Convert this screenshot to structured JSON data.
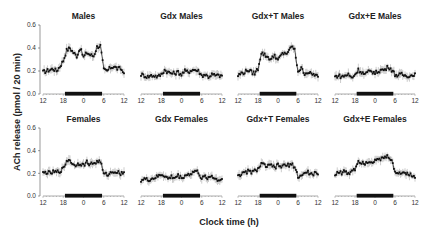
{
  "chart_data": {
    "type": "line",
    "layout": "2x4 small multiples with error bars",
    "ylabel": "ACh release (pmol / 20 min)",
    "xlabel": "Clock time (h)",
    "ylim": [
      0.0,
      0.6
    ],
    "yticks": [
      "0.0",
      "0.2",
      "0.4",
      "0.6"
    ],
    "xticks": [
      "12",
      "18",
      "0",
      "6",
      "12"
    ],
    "dark_period": {
      "start_hour": 18.5,
      "end_hour": 5.5,
      "label": "dark phase bar"
    },
    "grid": false,
    "legend": null,
    "panels": [
      {
        "title": "Males",
        "row": 0,
        "col": 0,
        "x": [
          12,
          13,
          14,
          15,
          16,
          17,
          18,
          19,
          20,
          21,
          22,
          23,
          0,
          1,
          2,
          3,
          4,
          5,
          6,
          7,
          8,
          9,
          10,
          11,
          12
        ],
        "values": [
          0.19,
          0.2,
          0.21,
          0.22,
          0.2,
          0.24,
          0.29,
          0.38,
          0.4,
          0.36,
          0.33,
          0.4,
          0.32,
          0.36,
          0.34,
          0.33,
          0.41,
          0.42,
          0.21,
          0.2,
          0.23,
          0.24,
          0.22,
          0.22,
          0.18
        ]
      },
      {
        "title": "Gdx Males",
        "row": 0,
        "col": 1,
        "x": [
          12,
          13,
          14,
          15,
          16,
          17,
          18,
          19,
          20,
          21,
          22,
          23,
          0,
          1,
          2,
          3,
          4,
          5,
          6,
          7,
          8,
          9,
          10,
          11,
          12
        ],
        "values": [
          0.17,
          0.16,
          0.15,
          0.16,
          0.16,
          0.15,
          0.17,
          0.21,
          0.19,
          0.18,
          0.18,
          0.19,
          0.17,
          0.2,
          0.19,
          0.21,
          0.21,
          0.2,
          0.16,
          0.17,
          0.15,
          0.17,
          0.16,
          0.16,
          0.16
        ]
      },
      {
        "title": "Gdx+T Males",
        "row": 0,
        "col": 2,
        "x": [
          12,
          13,
          14,
          15,
          16,
          17,
          18,
          19,
          20,
          21,
          22,
          23,
          0,
          1,
          2,
          3,
          4,
          5,
          6,
          7,
          8,
          9,
          10,
          11,
          12
        ],
        "values": [
          0.16,
          0.18,
          0.19,
          0.21,
          0.19,
          0.18,
          0.22,
          0.36,
          0.34,
          0.32,
          0.3,
          0.34,
          0.29,
          0.34,
          0.36,
          0.35,
          0.42,
          0.38,
          0.2,
          0.22,
          0.18,
          0.19,
          0.17,
          0.17,
          0.15
        ]
      },
      {
        "title": "Gdx+E  Males",
        "row": 0,
        "col": 3,
        "x": [
          12,
          13,
          14,
          15,
          16,
          17,
          18,
          19,
          20,
          21,
          22,
          23,
          0,
          1,
          2,
          3,
          4,
          5,
          6,
          7,
          8,
          9,
          10,
          11,
          12
        ],
        "values": [
          0.15,
          0.16,
          0.15,
          0.16,
          0.17,
          0.14,
          0.17,
          0.21,
          0.19,
          0.17,
          0.19,
          0.2,
          0.18,
          0.2,
          0.21,
          0.21,
          0.24,
          0.21,
          0.17,
          0.16,
          0.17,
          0.16,
          0.16,
          0.16,
          0.18
        ]
      },
      {
        "title": "Females",
        "row": 1,
        "col": 0,
        "x": [
          12,
          13,
          14,
          15,
          16,
          17,
          18,
          19,
          20,
          21,
          22,
          23,
          0,
          1,
          2,
          3,
          4,
          5,
          6,
          7,
          8,
          9,
          10,
          11,
          12
        ],
        "values": [
          0.2,
          0.21,
          0.2,
          0.21,
          0.21,
          0.22,
          0.24,
          0.31,
          0.32,
          0.27,
          0.28,
          0.29,
          0.27,
          0.3,
          0.28,
          0.29,
          0.3,
          0.31,
          0.19,
          0.19,
          0.2,
          0.22,
          0.21,
          0.2,
          0.21
        ]
      },
      {
        "title": "Gdx Females",
        "row": 1,
        "col": 1,
        "x": [
          12,
          13,
          14,
          15,
          16,
          17,
          18,
          19,
          20,
          21,
          22,
          23,
          0,
          1,
          2,
          3,
          4,
          5,
          6,
          7,
          8,
          9,
          10,
          11,
          12
        ],
        "values": [
          0.14,
          0.15,
          0.14,
          0.15,
          0.16,
          0.17,
          0.19,
          0.18,
          0.15,
          0.17,
          0.16,
          0.18,
          0.16,
          0.18,
          0.19,
          0.2,
          0.22,
          0.21,
          0.15,
          0.17,
          0.16,
          0.18,
          0.15,
          0.14,
          0.15
        ]
      },
      {
        "title": "Gdx+T  Females",
        "row": 1,
        "col": 2,
        "x": [
          12,
          13,
          14,
          15,
          16,
          17,
          18,
          19,
          20,
          21,
          22,
          23,
          0,
          1,
          2,
          3,
          4,
          5,
          6,
          7,
          8,
          9,
          10,
          11,
          12
        ],
        "values": [
          0.19,
          0.19,
          0.2,
          0.22,
          0.21,
          0.22,
          0.24,
          0.28,
          0.27,
          0.26,
          0.27,
          0.25,
          0.27,
          0.26,
          0.27,
          0.27,
          0.28,
          0.26,
          0.17,
          0.18,
          0.2,
          0.21,
          0.19,
          0.2,
          0.19
        ]
      },
      {
        "title": "Gdx+E  Females",
        "row": 1,
        "col": 3,
        "x": [
          12,
          13,
          14,
          15,
          16,
          17,
          18,
          19,
          20,
          21,
          22,
          23,
          0,
          1,
          2,
          3,
          4,
          5,
          6,
          7,
          8,
          9,
          10,
          11,
          12
        ],
        "values": [
          0.18,
          0.22,
          0.2,
          0.22,
          0.19,
          0.23,
          0.24,
          0.31,
          0.3,
          0.29,
          0.31,
          0.3,
          0.32,
          0.31,
          0.33,
          0.34,
          0.35,
          0.32,
          0.2,
          0.21,
          0.2,
          0.21,
          0.2,
          0.18,
          0.16
        ]
      }
    ]
  }
}
